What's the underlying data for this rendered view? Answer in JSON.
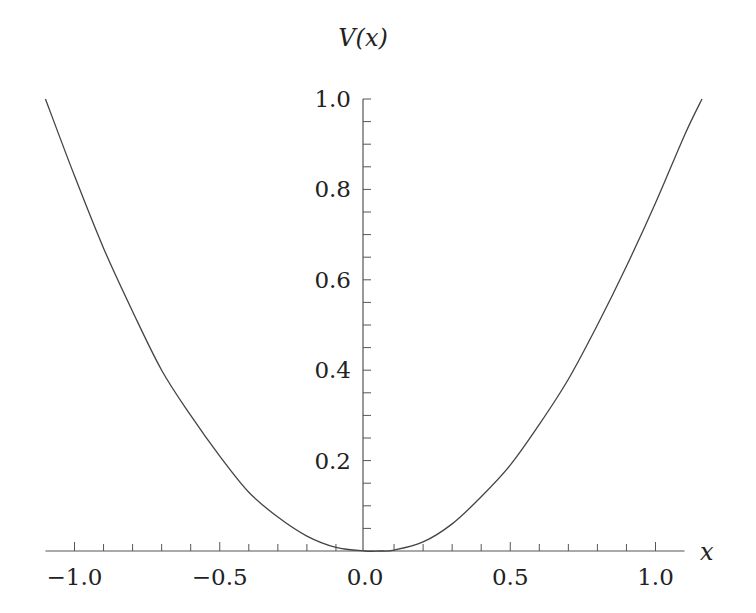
{
  "chart_data": {
    "type": "line",
    "title": "",
    "xlabel": "x",
    "ylabel": "V(x)",
    "xlim": [
      -1.1,
      1.1
    ],
    "ylim": [
      0,
      1.0
    ],
    "grid": false,
    "legend": null,
    "x_ticks": [
      -1.0,
      -0.5,
      0.0,
      0.5,
      1.0
    ],
    "x_tick_labels": [
      "−1.0",
      "−0.5",
      "0.0",
      "0.5",
      "1.0"
    ],
    "x_minor_step": 0.1,
    "y_ticks": [
      0.2,
      0.4,
      0.6,
      0.8,
      1.0
    ],
    "y_tick_labels": [
      "0.2",
      "0.4",
      "0.6",
      "0.8",
      "1.0"
    ],
    "y_minor_step": 0.05,
    "series": [
      {
        "name": "V(x)",
        "x": [
          -1.1,
          -1.0,
          -0.9,
          -0.8,
          -0.7,
          -0.6,
          -0.5,
          -0.4,
          -0.3,
          -0.2,
          -0.1,
          0.0,
          0.05,
          0.1,
          0.2,
          0.3,
          0.4,
          0.5,
          0.6,
          0.7,
          0.8,
          0.9,
          1.0,
          1.1,
          1.16
        ],
        "values": [
          1.0,
          0.83,
          0.67,
          0.53,
          0.4,
          0.3,
          0.21,
          0.13,
          0.075,
          0.033,
          0.008,
          0.0,
          0.0,
          0.002,
          0.02,
          0.06,
          0.12,
          0.19,
          0.28,
          0.38,
          0.5,
          0.63,
          0.77,
          0.92,
          1.0
        ]
      }
    ]
  }
}
